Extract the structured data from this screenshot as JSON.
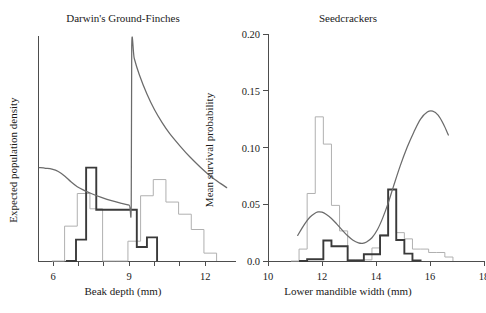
{
  "figure": {
    "name": "two-panel-evolutionary-biology-figure",
    "background": "#ffffff",
    "colors": {
      "axis": "#4d4d4d",
      "text": "#1a1a1a",
      "hist_light": "#b0b0b0",
      "hist_dark": "#3a3a3a",
      "curve": "#6b6b6b"
    }
  },
  "chart_data": [
    {
      "id": "finches",
      "type": "area",
      "title": "Darwin's Ground-Finches",
      "xlabel": "Beak depth (mm)",
      "ylabel": "Expected population density",
      "xlim": [
        5.4,
        12.9
      ],
      "ylim": [
        0,
        1
      ],
      "grid": false,
      "legend": "none",
      "xticks": [
        6,
        7,
        8,
        9,
        10,
        11,
        12
      ],
      "xtick_labels": [
        "6",
        "",
        "",
        "9",
        "",
        "",
        "12"
      ],
      "yticks": [],
      "ytick_labels": [],
      "series": [
        {
          "name": "Expected population density",
          "style": "curve",
          "color": "#6b6b6b",
          "points": [
            [
              5.45,
              0.415
            ],
            [
              5.7,
              0.412
            ],
            [
              5.95,
              0.408
            ],
            [
              6.2,
              0.398
            ],
            [
              6.45,
              0.378
            ],
            [
              6.7,
              0.352
            ],
            [
              6.95,
              0.33
            ],
            [
              7.2,
              0.315
            ],
            [
              7.5,
              0.3
            ],
            [
              7.9,
              0.283
            ],
            [
              8.3,
              0.268
            ],
            [
              8.7,
              0.256
            ],
            [
              9.0,
              0.248
            ],
            [
              9.08,
              0.247
            ],
            [
              9.1,
              0.955
            ],
            [
              9.2,
              0.9
            ],
            [
              9.4,
              0.828
            ],
            [
              9.7,
              0.742
            ],
            [
              10.0,
              0.672
            ],
            [
              10.3,
              0.615
            ],
            [
              10.6,
              0.566
            ],
            [
              11.0,
              0.512
            ],
            [
              11.4,
              0.462
            ],
            [
              11.8,
              0.418
            ],
            [
              12.2,
              0.378
            ],
            [
              12.6,
              0.345
            ],
            [
              12.85,
              0.326
            ]
          ]
        },
        {
          "name": "Small-beak morph frequency histogram",
          "style": "step-histogram",
          "color": "#3a3a3a",
          "weight": "bold",
          "bin_edges": [
            6.5,
            6.9,
            7.3,
            7.7,
            8.1,
            8.5,
            8.9,
            9.3,
            9.7,
            10.1
          ],
          "values": [
            0.0,
            0.095,
            0.415,
            0.228,
            0.228,
            0.228,
            0.228,
            0.062,
            0.105
          ]
        },
        {
          "name": "Large-beak morph frequency histogram",
          "style": "step-histogram",
          "color": "#b0b0b0",
          "weight": "light",
          "bin_edges": [
            5.95,
            6.45,
            6.95,
            7.45,
            7.95,
            8.45,
            8.95,
            9.45,
            9.95,
            10.45,
            10.95,
            11.45,
            11.95,
            12.45
          ],
          "values": [
            0.0,
            0.155,
            0.3,
            0.232,
            0.0,
            0.0,
            0.088,
            0.29,
            0.362,
            0.262,
            0.208,
            0.14,
            0.035
          ]
        }
      ]
    },
    {
      "id": "seedcrackers",
      "type": "area",
      "title": "Seedcrackers",
      "xlabel": "Lower mandible width (mm)",
      "ylabel": "Mean survival probability",
      "xlim": [
        10,
        18
      ],
      "ylim": [
        0.0,
        0.2
      ],
      "grid": false,
      "legend": "none",
      "xticks": [
        10,
        12,
        14,
        16,
        18
      ],
      "xtick_labels": [
        "10",
        "12",
        "14",
        "16",
        "18"
      ],
      "yticks": [
        0.0,
        0.05,
        0.1,
        0.15,
        0.2
      ],
      "ytick_labels": [
        "0.0",
        "0.05",
        "0.10",
        "0.15",
        "0.20"
      ],
      "series": [
        {
          "name": "Mean survival probability curve",
          "style": "curve",
          "color": "#6b6b6b",
          "points": [
            [
              11.1,
              0.0225
            ],
            [
              11.25,
              0.0285
            ],
            [
              11.4,
              0.034
            ],
            [
              11.55,
              0.0385
            ],
            [
              11.7,
              0.0415
            ],
            [
              11.85,
              0.0432
            ],
            [
              12.0,
              0.043
            ],
            [
              12.15,
              0.0412
            ],
            [
              12.35,
              0.0375
            ],
            [
              12.55,
              0.0325
            ],
            [
              12.75,
              0.0272
            ],
            [
              12.95,
              0.0222
            ],
            [
              13.15,
              0.0183
            ],
            [
              13.35,
              0.016
            ],
            [
              13.5,
              0.0156
            ],
            [
              13.65,
              0.0168
            ],
            [
              13.85,
              0.0205
            ],
            [
              14.05,
              0.0275
            ],
            [
              14.25,
              0.038
            ],
            [
              14.45,
              0.051
            ],
            [
              14.65,
              0.066
            ],
            [
              14.9,
              0.084
            ],
            [
              15.15,
              0.1
            ],
            [
              15.4,
              0.1135
            ],
            [
              15.65,
              0.125
            ],
            [
              15.9,
              0.1312
            ],
            [
              16.1,
              0.132
            ],
            [
              16.3,
              0.1285
            ],
            [
              16.5,
              0.1205
            ],
            [
              16.68,
              0.111
            ]
          ]
        },
        {
          "name": "Observed frequency histogram (light)",
          "style": "step-histogram",
          "color": "#b0b0b0",
          "weight": "light",
          "bin_edges": [
            10.85,
            11.15,
            11.45,
            11.75,
            12.05,
            12.35,
            12.65,
            12.95,
            13.25,
            13.55,
            13.85,
            14.15,
            14.45,
            14.75,
            15.05,
            15.35,
            15.65,
            15.95,
            16.25,
            16.55,
            16.85
          ],
          "values": [
            0.0,
            0.0105,
            0.0595,
            0.127,
            0.103,
            0.049,
            0.0265,
            0.001,
            0.001,
            0.001,
            0.0115,
            0.023,
            0.063,
            0.025,
            0.0195,
            0.0105,
            0.0105,
            0.0075,
            0.0075,
            0.0035
          ]
        },
        {
          "name": "Observed frequency histogram (dark)",
          "style": "step-histogram",
          "color": "#3a3a3a",
          "weight": "bold",
          "bin_edges": [
            11.15,
            11.45,
            11.75,
            12.05,
            12.35,
            12.65,
            12.95,
            13.25,
            13.55,
            13.85,
            14.15,
            14.45,
            14.75,
            15.05,
            15.35,
            15.65
          ],
          "values": [
            0.0,
            0.0015,
            0.0015,
            0.018,
            0.013,
            0.013,
            0.0005,
            0.0005,
            0.006,
            0.006,
            0.0225,
            0.063,
            0.0185,
            0.0065,
            0.0005
          ]
        }
      ]
    }
  ]
}
